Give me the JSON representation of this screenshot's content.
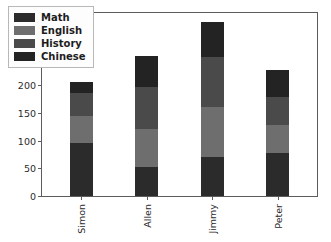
{
  "chart_data": {
    "type": "bar",
    "subtype": "stacked-bar",
    "title": "",
    "xlabel": "",
    "ylabel": "",
    "categories": [
      "Simon",
      "Allen",
      "Jimmy",
      "Peter"
    ],
    "series": [
      {
        "name": "Math",
        "color": "#2b2b2b",
        "values": [
          95,
          52,
          70,
          78
        ]
      },
      {
        "name": "English",
        "color": "#6e6e6e",
        "values": [
          50,
          68,
          90,
          50
        ]
      },
      {
        "name": "History",
        "color": "#4a4a4a",
        "values": [
          40,
          76,
          90,
          50
        ]
      },
      {
        "name": "Chinese",
        "color": "#232323",
        "values": [
          20,
          57,
          64,
          50
        ]
      }
    ],
    "totals": [
      205,
      253,
      314,
      228
    ],
    "ylim": [
      0,
      330
    ],
    "yticks": [
      0,
      50,
      100,
      150,
      200,
      250,
      300
    ],
    "ytick_labels": [
      "0",
      "50",
      "100",
      "150",
      "200",
      "250",
      "300"
    ],
    "xlim": [
      -0.6,
      3.6
    ],
    "grid": false,
    "legend": {
      "position": "upper-left",
      "entries": [
        {
          "label": "Math",
          "color": "#2b2b2b"
        },
        {
          "label": "English",
          "color": "#6e6e6e"
        },
        {
          "label": "History",
          "color": "#4a4a4a"
        },
        {
          "label": "Chinese",
          "color": "#232323"
        }
      ]
    },
    "style": {
      "background": "#ffffff",
      "axis_color": "#5c5c5c",
      "tick_label_color": "#2b2b2b",
      "xtick_rotation": 90,
      "bar_width_fraction": 0.35
    }
  }
}
